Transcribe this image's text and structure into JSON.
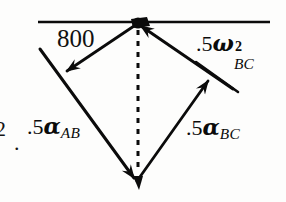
{
  "figure": {
    "name": "acceleration-vector-diagram",
    "type": "vector-polygon-diagram",
    "canvas": {
      "width": 286,
      "height": 202
    },
    "background_color": "#fdfdfc",
    "ink_color": "#0b0b0b"
  },
  "labels": {
    "magnitude_800": "800",
    "omega_bc": {
      "coefficient": ".5",
      "symbol": "ω",
      "superscript": "2",
      "subscript": "BC"
    },
    "alpha_ab": {
      "coefficient": ".5",
      "symbol": "α",
      "subscript": "AB"
    },
    "alpha_bc": {
      "coefficient": ".5",
      "symbol": "α",
      "subscript": "BC"
    },
    "margin_two": "2",
    "margin_period": "."
  },
  "geometry": {
    "apex_point": {
      "x": 138,
      "y": 23
    },
    "bottom_point": {
      "x": 137,
      "y": 182
    },
    "reference_line": {
      "x1": 38,
      "y1": 22,
      "x2": 270,
      "y2": 22
    },
    "left_long_line": {
      "x1": 40,
      "y1": 50,
      "x2": 137,
      "y2": 182
    },
    "right_long_line": {
      "x1": 138,
      "y1": 23,
      "x2": 233,
      "y2": 88
    },
    "arrow_800": {
      "from": {
        "x": 138,
        "y": 23
      },
      "to": {
        "x": 63,
        "y": 74
      }
    },
    "arrow_omega_bc": {
      "from": {
        "x": 233,
        "y": 88
      },
      "to": {
        "x": 140,
        "y": 25
      }
    },
    "arrow_alpha_bc": {
      "from": {
        "x": 137,
        "y": 182
      },
      "to": {
        "x": 211,
        "y": 78
      }
    },
    "arrow_alpha_ab": {
      "from": {
        "x": 40,
        "y": 50
      },
      "to": {
        "x": 137,
        "y": 182
      }
    },
    "dashed_line": {
      "x1": 138,
      "y1": 30,
      "x2": 138,
      "y2": 180,
      "style": "dashed"
    }
  },
  "chart_data": {
    "type": "diagram",
    "title": "",
    "vectors": [
      {
        "name": "800",
        "label": "800",
        "direction_deg": 214,
        "head_at": [
          63,
          74
        ],
        "tail_at": [
          138,
          23
        ]
      },
      {
        "name": ".5ω²_BC",
        "label": ".5ω²BC",
        "direction_deg": 214,
        "head_at": [
          140,
          25
        ],
        "tail_at": [
          233,
          88
        ]
      },
      {
        "name": ".5α_BC",
        "label": ".5αBC",
        "direction_deg": 305,
        "head_at": [
          211,
          78
        ],
        "tail_at": [
          137,
          182
        ]
      },
      {
        "name": ".5α_AB",
        "label": ".5αAB",
        "direction_deg": 306,
        "head_at": [
          137,
          182
        ],
        "tail_at": [
          40,
          50
        ]
      },
      {
        "name": "resultant-dashed",
        "label": "",
        "direction_deg": 270,
        "head_at": [
          138,
          180
        ],
        "tail_at": [
          138,
          30
        ]
      }
    ]
  }
}
